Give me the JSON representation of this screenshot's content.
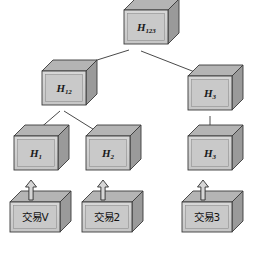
{
  "diagram": {
    "type": "merkle-tree",
    "colors": {
      "face_fill": "#d0d0d0",
      "face_inner_fill": "#c9c9c9",
      "top_fill": "#b4b4b4",
      "side_fill": "#9a9a9a",
      "stroke": "#3a3a3a",
      "line": "#4a4a4a",
      "text": "#111111",
      "background": "#ffffff"
    },
    "nodes": [
      {
        "id": "h123",
        "label_base": "H",
        "label_sub": "123",
        "level": 0,
        "x": 124,
        "y": 10,
        "w": 44,
        "h": 34,
        "depth": 11
      },
      {
        "id": "h12",
        "label_base": "H",
        "label_sub": "12",
        "level": 1,
        "x": 42,
        "y": 71,
        "w": 44,
        "h": 34,
        "depth": 11
      },
      {
        "id": "h3_upper",
        "label_base": "H",
        "label_sub": "3",
        "level": 1,
        "x": 188,
        "y": 76,
        "w": 44,
        "h": 34,
        "depth": 11
      },
      {
        "id": "h1",
        "label_base": "H",
        "label_sub": "1",
        "level": 2,
        "x": 14,
        "y": 136,
        "w": 44,
        "h": 34,
        "depth": 11
      },
      {
        "id": "h2",
        "label_base": "H",
        "label_sub": "2",
        "level": 2,
        "x": 86,
        "y": 136,
        "w": 44,
        "h": 34,
        "depth": 11
      },
      {
        "id": "h3_lower",
        "label_base": "H",
        "label_sub": "3",
        "level": 2,
        "x": 188,
        "y": 136,
        "w": 44,
        "h": 34,
        "depth": 11
      }
    ],
    "transactions": [
      {
        "id": "tx1",
        "label": "交易V",
        "x": 10,
        "y": 202,
        "w": 50,
        "h": 30,
        "depth": 11
      },
      {
        "id": "tx2",
        "label": "交易2",
        "x": 82,
        "y": 202,
        "w": 50,
        "h": 30,
        "depth": 11
      },
      {
        "id": "tx3",
        "label": "交易3",
        "x": 182,
        "y": 202,
        "w": 50,
        "h": 30,
        "depth": 11
      }
    ],
    "edges": [
      {
        "id": "edge-h123-h12",
        "from": "h123",
        "to": "h12",
        "x1": 129,
        "y1": 50,
        "x2": 62,
        "y2": 71
      },
      {
        "id": "edge-h123-h3",
        "from": "h123",
        "to": "h3_upper",
        "x1": 141,
        "y1": 51,
        "x2": 205,
        "y2": 76
      },
      {
        "id": "edge-h12-h1",
        "from": "h12",
        "to": "h1",
        "x1": 60,
        "y1": 111,
        "x2": 31,
        "y2": 136
      },
      {
        "id": "edge-h12-h2",
        "from": "h12",
        "to": "h2",
        "x1": 64,
        "y1": 111,
        "x2": 104,
        "y2": 136
      },
      {
        "id": "edge-h3-h3",
        "from": "h3_upper",
        "to": "h3_lower",
        "x1": 210,
        "y1": 116,
        "x2": 210,
        "y2": 136
      }
    ],
    "arrows": [
      {
        "id": "arrow-tx1-h1",
        "from": "tx1",
        "to": "h1",
        "cx": 31,
        "top": 180,
        "bottom": 200
      },
      {
        "id": "arrow-tx2-h2",
        "from": "tx2",
        "to": "h2",
        "cx": 103,
        "top": 180,
        "bottom": 200
      },
      {
        "id": "arrow-tx3-h3",
        "from": "tx3",
        "to": "h3_lower",
        "cx": 203,
        "top": 180,
        "bottom": 200
      }
    ]
  }
}
